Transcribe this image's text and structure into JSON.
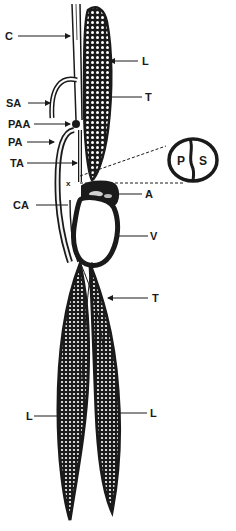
{
  "figure": {
    "type": "anatomical-diagram",
    "background": "#ffffff",
    "ink": "#1a1a1a",
    "labels": {
      "c": "C",
      "l_top": "L",
      "t_top": "T",
      "sa": "SA",
      "paa": "PAA",
      "pa": "PA",
      "ta": "TA",
      "x": "x",
      "ca": "CA",
      "a": "A",
      "v": "V",
      "t_bottom": "T",
      "l_left": "L",
      "l_right": "L"
    },
    "inset": {
      "left_label": "P",
      "right_label": "S"
    }
  }
}
